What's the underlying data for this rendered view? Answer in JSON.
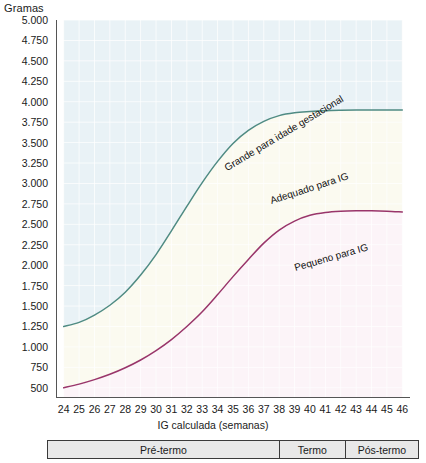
{
  "chart_data": {
    "type": "line",
    "title": "",
    "ylabel": "Gramas",
    "xlabel": "IG calculada (semanas)",
    "xlim": [
      23.5,
      46.5
    ],
    "ylim": [
      375,
      5000
    ],
    "grid": true,
    "legend_position": "inline-annotations",
    "x": [
      24,
      25,
      26,
      27,
      28,
      29,
      30,
      31,
      32,
      33,
      34,
      35,
      36,
      37,
      38,
      39,
      40,
      41,
      42,
      43,
      44,
      45,
      46
    ],
    "y_ticks": [
      "500",
      "750",
      "1.000",
      "1.250",
      "1.500",
      "1.750",
      "2.000",
      "2.250",
      "2.500",
      "2.750",
      "3.000",
      "3.250",
      "3.500",
      "3.750",
      "4.000",
      "4.250",
      "4.500",
      "4.750",
      "5.000"
    ],
    "y_tick_values": [
      500,
      750,
      1000,
      1250,
      1500,
      1750,
      2000,
      2250,
      2500,
      2750,
      3000,
      3250,
      3500,
      3750,
      4000,
      4250,
      4500,
      4750,
      5000
    ],
    "x_ticks": [
      "24",
      "25",
      "26",
      "27",
      "28",
      "29",
      "30",
      "31",
      "32",
      "33",
      "34",
      "35",
      "36",
      "37",
      "38",
      "39",
      "40",
      "41",
      "42",
      "43",
      "44",
      "45",
      "46"
    ],
    "series": [
      {
        "name": "Percentil superior (Grande para idade gestacional)",
        "color": "#4f8b83",
        "values": [
          1250,
          1300,
          1390,
          1510,
          1670,
          1880,
          2130,
          2420,
          2720,
          3010,
          3270,
          3490,
          3650,
          3760,
          3830,
          3865,
          3880,
          3890,
          3895,
          3898,
          3900,
          3900,
          3900
        ]
      },
      {
        "name": "Percentil inferior (Pequeno para IG)",
        "color": "#99356a",
        "values": [
          500,
          545,
          600,
          665,
          745,
          840,
          955,
          1090,
          1250,
          1430,
          1640,
          1860,
          2070,
          2270,
          2430,
          2540,
          2610,
          2645,
          2660,
          2665,
          2665,
          2660,
          2650
        ]
      }
    ],
    "band_labels": [
      {
        "text": "Grande para idade gestacional",
        "rotation": -31
      },
      {
        "text": "Adequado para IG",
        "rotation": -18
      },
      {
        "text": "Pequeno para IG",
        "rotation": -16
      }
    ],
    "band_colors": {
      "upper": "#e9f2f6",
      "middle": "#fbfaf0",
      "lower": "#fcf4f8"
    }
  },
  "axes": {
    "y_title": "Gramas",
    "x_title": "IG calculada (semanas)"
  },
  "annotations": {
    "large_for_age": "Grande para idade gestacional",
    "appropriate_for_age": "Adequado para IG",
    "small_for_age": "Pequeno para IG"
  },
  "period_bar": {
    "cells": [
      {
        "label": "Pré-termo",
        "flex": 640
      },
      {
        "label": "Termo",
        "flex": 180
      },
      {
        "label": "Pós-termo",
        "flex": 200
      }
    ]
  }
}
